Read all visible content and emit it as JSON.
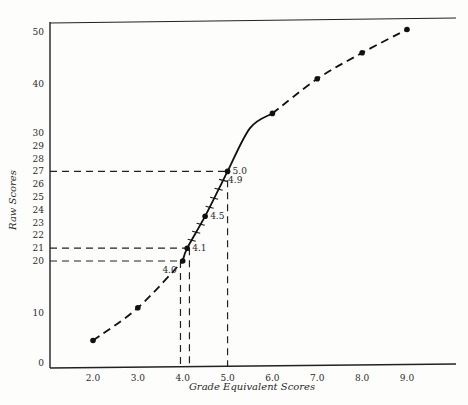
{
  "chart_data": {
    "type": "line",
    "title": "",
    "xlabel": "Grade Equivalent Scores",
    "ylabel": "Raw Scores",
    "xlim": [
      1.0,
      10.2
    ],
    "ylim": [
      0,
      52
    ],
    "x_ticks": [
      {
        "value": 2.0,
        "label": "2.0"
      },
      {
        "value": 3.0,
        "label": "3.0"
      },
      {
        "value": 4.0,
        "label": "4.0"
      },
      {
        "value": 5.0,
        "label": "5.0"
      },
      {
        "value": 6.0,
        "label": "6.0"
      },
      {
        "value": 7.0,
        "label": "7.0"
      },
      {
        "value": 8.0,
        "label": "8.0"
      },
      {
        "value": 9.0,
        "label": "9.0"
      }
    ],
    "y_ticks": [
      {
        "value": 0,
        "label": "0"
      },
      {
        "value": 10,
        "label": "10"
      },
      {
        "value": 20,
        "label": "20"
      },
      {
        "value": 21,
        "label": "21"
      },
      {
        "value": 22,
        "label": "22"
      },
      {
        "value": 23,
        "label": "23"
      },
      {
        "value": 24,
        "label": "24"
      },
      {
        "value": 25,
        "label": "25"
      },
      {
        "value": 26,
        "label": "26"
      },
      {
        "value": 27,
        "label": "27"
      },
      {
        "value": 28,
        "label": "28"
      },
      {
        "value": 29,
        "label": "29"
      },
      {
        "value": 30,
        "label": "30"
      },
      {
        "value": 40,
        "label": "40"
      },
      {
        "value": 50,
        "label": "50"
      }
    ],
    "grid": false,
    "series": [
      {
        "name": "extrapolated-lower",
        "style": "dashed",
        "points": [
          [
            2.0,
            4.5
          ],
          [
            3.0,
            11
          ],
          [
            4.0,
            20
          ]
        ]
      },
      {
        "name": "normed-range",
        "style": "solid",
        "points": [
          [
            4.0,
            20
          ],
          [
            4.1,
            21
          ],
          [
            4.5,
            23.5
          ],
          [
            4.9,
            26.3
          ],
          [
            5.0,
            27
          ],
          [
            5.5,
            31
          ],
          [
            6.0,
            34
          ]
        ]
      },
      {
        "name": "extrapolated-upper",
        "style": "dashed",
        "points": [
          [
            6.0,
            34
          ],
          [
            7.0,
            41
          ],
          [
            8.0,
            46
          ],
          [
            9.0,
            50.5
          ]
        ]
      }
    ],
    "markers": [
      {
        "x": 2.0,
        "y": 4.5
      },
      {
        "x": 3.0,
        "y": 11
      },
      {
        "x": 4.0,
        "y": 20
      },
      {
        "x": 4.1,
        "y": 21
      },
      {
        "x": 4.5,
        "y": 23.5
      },
      {
        "x": 5.0,
        "y": 27
      },
      {
        "x": 6.0,
        "y": 34
      },
      {
        "x": 7.0,
        "y": 41
      },
      {
        "x": 8.0,
        "y": 46
      },
      {
        "x": 9.0,
        "y": 50.5
      }
    ],
    "minor_ticks_on_curve": [
      4.2,
      4.3,
      4.4,
      4.6,
      4.7,
      4.8,
      4.9
    ],
    "annotations": [
      {
        "text": "4.0",
        "x": 4.0,
        "y": 20,
        "side": "left"
      },
      {
        "text": "4.1",
        "x": 4.1,
        "y": 21,
        "side": "right"
      },
      {
        "text": "4.5",
        "x": 4.5,
        "y": 23.5,
        "side": "right"
      },
      {
        "text": "4.9",
        "x": 4.9,
        "y": 26.3,
        "side": "right"
      },
      {
        "text": "5.0",
        "x": 5.0,
        "y": 27,
        "side": "right"
      }
    ],
    "reference_lines": [
      {
        "type": "horizontal",
        "y": 20,
        "x_to": 4.0
      },
      {
        "type": "horizontal",
        "y": 21,
        "x_to": 4.1
      },
      {
        "type": "horizontal",
        "y": 27,
        "x_to": 5.0
      },
      {
        "type": "vertical",
        "x": 3.95,
        "y_to": 20
      },
      {
        "type": "vertical",
        "x": 4.15,
        "y_to": 21
      },
      {
        "type": "vertical",
        "x": 5.0,
        "y_to": 26.3
      }
    ]
  }
}
